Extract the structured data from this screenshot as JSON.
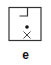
{
  "panel": {
    "label": "e",
    "colors": {
      "stroke": "#333333",
      "background": "#ffffff"
    },
    "symbols": [
      {
        "type": "box-outline",
        "icon": "square-outline"
      },
      {
        "type": "corner-notch",
        "icon": "l-corner"
      },
      {
        "type": "dot",
        "icon": "filled-dot"
      },
      {
        "type": "cross",
        "icon": "x-mark"
      }
    ]
  }
}
